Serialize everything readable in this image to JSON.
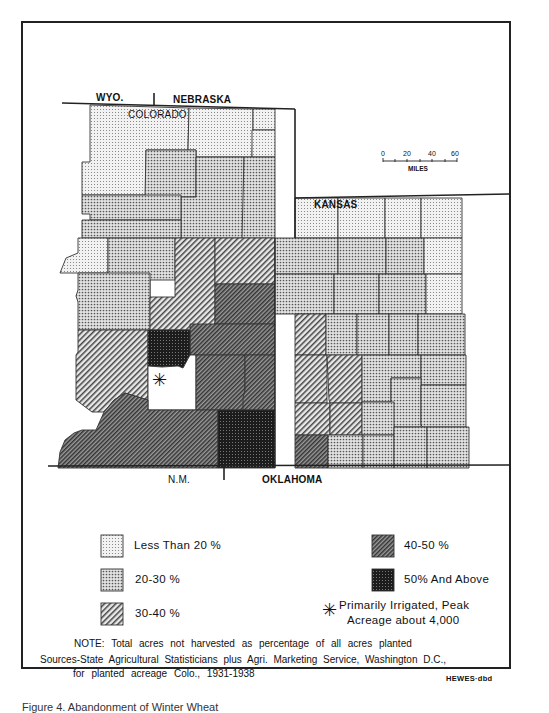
{
  "map": {
    "state_labels": {
      "wyoming": "WYO.",
      "nebraska": "NEBRASKA",
      "colorado": "COLORADO",
      "kansas": "KANSAS",
      "new_mexico": "N.M.",
      "oklahoma": "OKLAHOMA"
    },
    "scale": {
      "ticks": [
        "0",
        "20",
        "40",
        "60"
      ],
      "unit": "MILES"
    },
    "irrigated_marker": "✳"
  },
  "legend": {
    "items": [
      {
        "key": "lt20",
        "label": "Less Than 20 %",
        "color": "#e6e6e6"
      },
      {
        "key": "20to30",
        "label": "20-30 %",
        "color": "#cfcfcf"
      },
      {
        "key": "30to40",
        "label": "30-40 %",
        "color": "#b8b8b8"
      },
      {
        "key": "40to50",
        "label": "40-50 %",
        "color": "#6e6e6e"
      },
      {
        "key": "50plus",
        "label": "50% And Above",
        "color": "#1e1e1e"
      }
    ],
    "irrigated": {
      "symbol": "✳",
      "line1": "Primarily  Irrigated,  Peak",
      "line2": "Acreage   about   4,000"
    }
  },
  "notes": {
    "note": "NOTE: Total acres not harvested as percentage of all acres planted",
    "sources_line1": "Sources-State Agricultural Statisticians plus Agri. Marketing Service, Washington D.C.,",
    "sources_line2": "for planted acreage Colo., 1931-1938",
    "credit": "HEWES·dbd"
  },
  "caption": "Figure 4. Abandonment of Winter Wheat"
}
